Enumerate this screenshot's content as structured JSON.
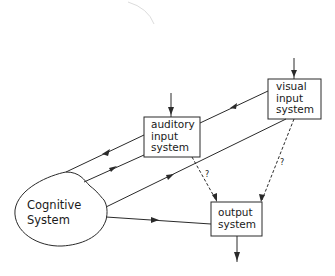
{
  "diagram": {
    "nodes": {
      "visual": {
        "label": "visual\ninput\nsystem"
      },
      "auditory": {
        "label": "auditory\ninput\nsystem"
      },
      "output": {
        "label": "output\nsystem"
      },
      "cognitive": {
        "label": "Cognitive\nSystem"
      }
    },
    "edges": [
      {
        "from": "external",
        "to": "visual",
        "style": "solid"
      },
      {
        "from": "external",
        "to": "auditory",
        "style": "solid"
      },
      {
        "from": "visual",
        "to": "auditory",
        "style": "solid"
      },
      {
        "from": "auditory",
        "to": "cognitive",
        "style": "solid"
      },
      {
        "from": "cognitive",
        "to": "auditory",
        "style": "solid"
      },
      {
        "from": "cognitive",
        "to": "visual",
        "style": "solid"
      },
      {
        "from": "cognitive",
        "to": "output",
        "style": "solid"
      },
      {
        "from": "auditory",
        "to": "output",
        "style": "dashed",
        "label": "?"
      },
      {
        "from": "visual",
        "to": "output",
        "style": "dashed",
        "label": "?"
      },
      {
        "from": "output",
        "to": "external",
        "style": "solid"
      }
    ],
    "question_mark": "?"
  },
  "colors": {
    "stroke": "#2a2a2a",
    "background": "#ffffff"
  }
}
